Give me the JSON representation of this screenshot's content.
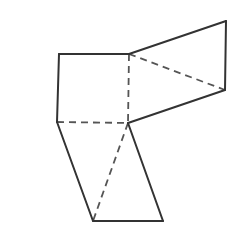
{
  "figure": {
    "label": "C",
    "kind": "geometric-net-wireframe",
    "canvas": {
      "width": 250,
      "height": 235,
      "background": "#ffffff"
    },
    "style": {
      "solid_stroke": "#333333",
      "dashed_stroke": "#555555",
      "solid_width": 2,
      "dashed_width": 1.8,
      "dash_pattern": "7 5",
      "label_color": "#231f20"
    },
    "vertices": {
      "square_top_left": {
        "x": 59,
        "y": 54
      },
      "square_top_right_hub": {
        "x": 129,
        "y": 54
      },
      "square_bottom_left": {
        "x": 57,
        "y": 122
      },
      "center_hub": {
        "x": 128,
        "y": 123
      },
      "wedge_top_right": {
        "x": 226,
        "y": 21
      },
      "wedge_bottom_right": {
        "x": 225,
        "y": 90
      },
      "lower_bottom_left": {
        "x": 93,
        "y": 221
      },
      "lower_bottom_right": {
        "x": 163,
        "y": 221
      }
    },
    "solid_edges": [
      {
        "name": "square-top-edge",
        "from": "square_top_left",
        "to": "square_top_right_hub"
      },
      {
        "name": "square-left-edge",
        "from": "square_top_left",
        "to": "square_bottom_left"
      },
      {
        "name": "wedge-upper-edge",
        "from": "square_top_right_hub",
        "to": "wedge_top_right"
      },
      {
        "name": "wedge-right-edge",
        "from": "wedge_top_right",
        "to": "wedge_bottom_right"
      },
      {
        "name": "wedge-lower-edge",
        "from": "wedge_bottom_right",
        "to": "center_hub"
      },
      {
        "name": "lower-left-edge",
        "from": "square_bottom_left",
        "to": "lower_bottom_left"
      },
      {
        "name": "lower-bottom-edge",
        "from": "lower_bottom_left",
        "to": "lower_bottom_right"
      },
      {
        "name": "lower-right-edge",
        "from": "lower_bottom_right",
        "to": "center_hub"
      }
    ],
    "dashed_edges": [
      {
        "name": "hidden-vertical-edge",
        "from": "square_top_right_hub",
        "to": "center_hub"
      },
      {
        "name": "hidden-horizontal-edge",
        "from": "square_bottom_left",
        "to": "center_hub"
      },
      {
        "name": "hidden-wedge-diagonal",
        "from": "square_top_right_hub",
        "to": "wedge_bottom_right"
      },
      {
        "name": "hidden-lower-diagonal",
        "from": "center_hub",
        "to": "lower_bottom_left"
      }
    ]
  }
}
